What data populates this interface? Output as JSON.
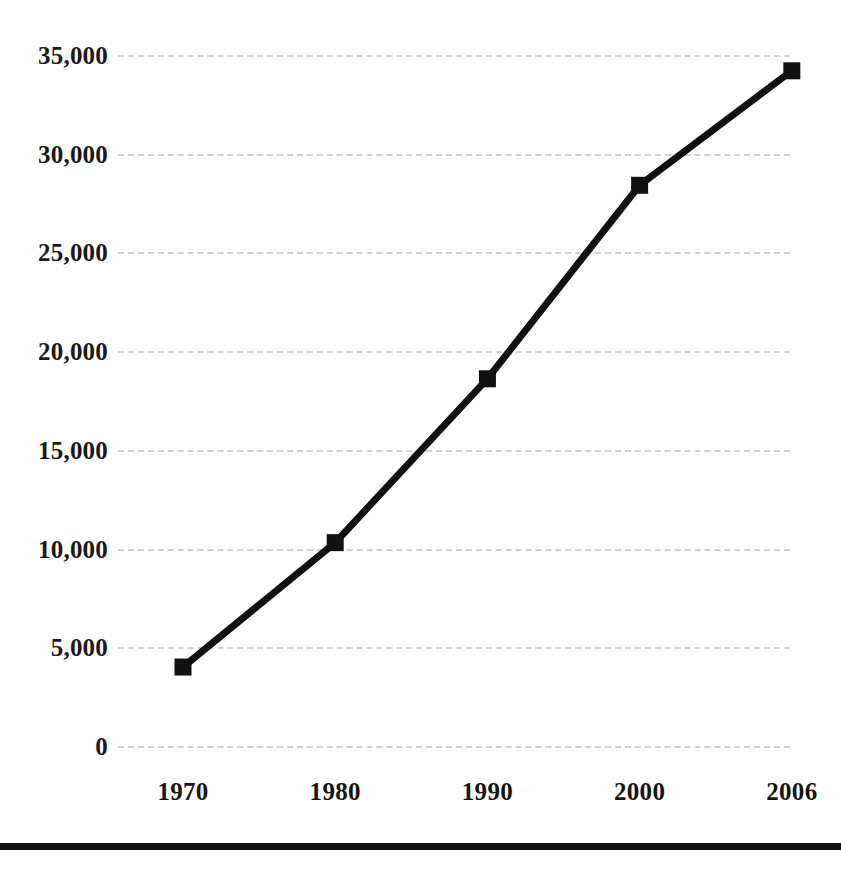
{
  "chart_data": {
    "type": "line",
    "title": "",
    "subtitle": "",
    "xlabel": "",
    "ylabel": "",
    "categories": [
      "1970",
      "1980",
      "1990",
      "2000",
      "2006"
    ],
    "x": [
      1970,
      1980,
      1990,
      2000,
      2006
    ],
    "values": [
      4000,
      10300,
      18600,
      28400,
      34200
    ],
    "series": [
      {
        "name": "",
        "values": [
          4000,
          10300,
          18600,
          28400,
          34200
        ]
      }
    ],
    "ylim": [
      0,
      35000
    ],
    "y_ticks": [
      0,
      5000,
      10000,
      15000,
      20000,
      25000,
      30000,
      35000
    ],
    "y_tick_labels": [
      "0",
      "5,000",
      "10,000",
      "15,000",
      "20,000",
      "25,000",
      "30,000",
      "35,000"
    ],
    "x_tick_labels": [
      "1970",
      "1980",
      "1990",
      "2000",
      "2006"
    ],
    "grid": true,
    "grid_axis": "y",
    "grid_style": "dashed",
    "legend": false,
    "legend_position": "none",
    "annotations": [],
    "colors": {
      "line": "#111111",
      "marker": "#111111",
      "gridline": "#d2d2d4",
      "text": "#1a1a1a",
      "background": "#ffffff",
      "rule": "#111111"
    },
    "marker_style": "square",
    "line_width_px": 7,
    "marker_size_px": 17
  },
  "figure": {
    "bottom_rule_visible": true
  }
}
